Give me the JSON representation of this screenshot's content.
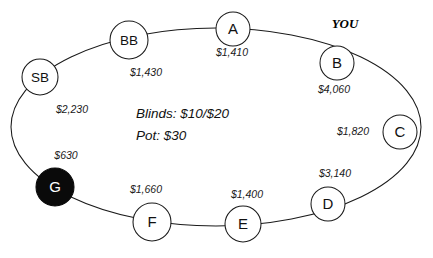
{
  "diagram": {
    "type": "poker-table",
    "center_info": {
      "blinds_line": "Blinds: $10/$20",
      "pot_line": "Pot: $30"
    },
    "hero_marker": {
      "label": "YOU",
      "seat": "B"
    },
    "colors": {
      "stroke": "#1a1a1a",
      "seat_fill": "#ffffff",
      "dealer_fill": "#0a0a0a",
      "text": "#111111",
      "background": "#ffffff"
    },
    "seats": [
      {
        "id": "SB",
        "label": "SB",
        "stack": "$2,230",
        "cx": 40,
        "cy": 77,
        "r": 18,
        "dealer": false,
        "stack_x": 72,
        "stack_y": 110
      },
      {
        "id": "BB",
        "label": "BB",
        "stack": "$1,430",
        "cx": 129,
        "cy": 40,
        "r": 19,
        "dealer": false,
        "stack_x": 146,
        "stack_y": 73
      },
      {
        "id": "A",
        "label": "A",
        "stack": "$1,410",
        "cx": 233,
        "cy": 29,
        "r": 17,
        "dealer": false,
        "stack_x": 232,
        "stack_y": 53
      },
      {
        "id": "B",
        "label": "B",
        "stack": "$4,060",
        "cx": 337,
        "cy": 63,
        "r": 17,
        "dealer": false,
        "stack_x": 334,
        "stack_y": 90
      },
      {
        "id": "C",
        "label": "C",
        "stack": "$1,820",
        "cx": 400,
        "cy": 132,
        "r": 17,
        "dealer": false,
        "stack_x": 353,
        "stack_y": 132
      },
      {
        "id": "D",
        "label": "D",
        "stack": "$3,140",
        "cx": 328,
        "cy": 204,
        "r": 17,
        "dealer": false,
        "stack_x": 335,
        "stack_y": 174
      },
      {
        "id": "E",
        "label": "E",
        "stack": "$1,400",
        "cx": 243,
        "cy": 224,
        "r": 18,
        "dealer": false,
        "stack_x": 247,
        "stack_y": 195
      },
      {
        "id": "F",
        "label": "F",
        "stack": "$1,660",
        "cx": 152,
        "cy": 222,
        "r": 19,
        "dealer": false,
        "stack_x": 146,
        "stack_y": 190
      },
      {
        "id": "G",
        "label": "G",
        "stack": "$630",
        "cx": 55,
        "cy": 187,
        "r": 19,
        "dealer": true,
        "stack_x": 66,
        "stack_y": 156
      }
    ]
  }
}
